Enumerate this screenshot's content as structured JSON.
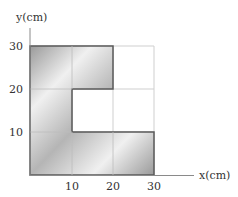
{
  "diagram": {
    "y_axis_label": "y(cm)",
    "x_axis_label": "x(cm)",
    "x_ticks": [
      "10",
      "20",
      "30"
    ],
    "y_ticks": [
      "10",
      "20",
      "30"
    ],
    "shape": "Uniform plate composed of squares forming a shape: column x 0–10 from y 0–30, top row x 10–20 y 20–30, bottom row x 10–30 y 0–10",
    "colors": {
      "grid": "#cccccc",
      "outline": "#555555",
      "fill_dark": "#9a9a9a",
      "fill_light": "#f4f4f4"
    }
  }
}
